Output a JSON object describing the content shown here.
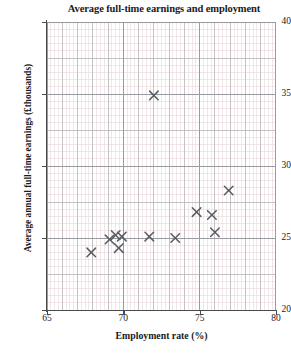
{
  "chart_data": {
    "type": "scatter",
    "title": "Average full-time earnings and employment",
    "xlabel": "Employment rate (%)",
    "ylabel": "Average annual full-time earnings (£thousands)",
    "xlim": [
      65,
      80
    ],
    "ylim": [
      20,
      40
    ],
    "x_major_ticks": [
      65,
      70,
      75,
      80
    ],
    "y_major_ticks": [
      20,
      25,
      30,
      35,
      40
    ],
    "x_minor_step": 0.25,
    "y_minor_step": 0.5,
    "x_major_step": 1,
    "y_major_step": 2.5,
    "grid": true,
    "legend": null,
    "marker": "x",
    "marker_color": "#5b5b63",
    "points": [
      {
        "x": 67.9,
        "y": 24.0
      },
      {
        "x": 69.1,
        "y": 24.9
      },
      {
        "x": 69.5,
        "y": 25.2
      },
      {
        "x": 69.9,
        "y": 25.1
      },
      {
        "x": 69.7,
        "y": 24.3
      },
      {
        "x": 71.7,
        "y": 25.1
      },
      {
        "x": 72.0,
        "y": 34.9
      },
      {
        "x": 73.4,
        "y": 25.0
      },
      {
        "x": 74.8,
        "y": 26.8
      },
      {
        "x": 75.8,
        "y": 26.6
      },
      {
        "x": 76.0,
        "y": 25.4
      },
      {
        "x": 76.9,
        "y": 28.3
      }
    ]
  },
  "colors": {
    "axis": "#4a4a4a",
    "major_grid": "#b9b9bd",
    "minor_grid": "#ead7d9",
    "marker": "#5b5b63",
    "text": "#1a1a1a",
    "background": "#ffffff"
  }
}
